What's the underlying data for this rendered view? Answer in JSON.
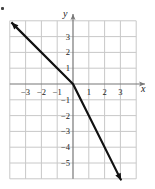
{
  "chart_data": {
    "type": "line",
    "title": "",
    "xlabel": "x",
    "ylabel": "y",
    "xlim": [
      -4,
      4
    ],
    "ylim": [
      -6,
      4
    ],
    "grid": true,
    "x_ticks": [
      -3,
      -2,
      -1,
      1,
      2,
      3
    ],
    "x_tick_labels": [
      "−3",
      "−2",
      "−1",
      "1",
      "2",
      "3"
    ],
    "y_ticks": [
      3,
      2,
      1,
      -1,
      -2,
      -3,
      -4,
      -5
    ],
    "y_tick_labels": [
      "3",
      "2",
      "1",
      "−1",
      "−2",
      "−3",
      "−4",
      "−5"
    ],
    "series": [
      {
        "name": "piecewise linear f(x)",
        "x": [
          -3.9,
          0,
          3.05
        ],
        "y": [
          3.9,
          0,
          -6.1
        ],
        "description": "y = -x for x <= 0, y = -2x for x > 0; arrows at both ends",
        "arrows": "both",
        "color": "#111111"
      }
    ],
    "legend": null
  },
  "colors": {
    "grid": "#c8c8c8",
    "axis": "#777777",
    "curve": "#111111",
    "text": "#222222"
  }
}
